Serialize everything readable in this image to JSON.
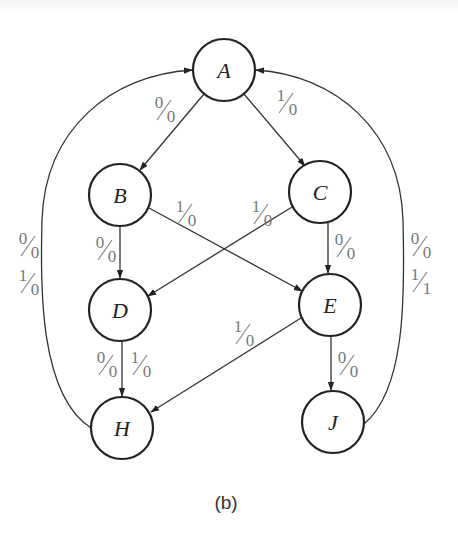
{
  "diagram": {
    "type": "state-diagram",
    "caption": "(b)",
    "states": [
      {
        "id": "A",
        "label": "A",
        "cx": 224,
        "cy": 70
      },
      {
        "id": "B",
        "label": "B",
        "cx": 120,
        "cy": 195
      },
      {
        "id": "C",
        "label": "C",
        "cx": 320,
        "cy": 192
      },
      {
        "id": "D",
        "label": "D",
        "cx": 120,
        "cy": 310
      },
      {
        "id": "E",
        "label": "E",
        "cx": 330,
        "cy": 305
      },
      {
        "id": "H",
        "label": "H",
        "cx": 122,
        "cy": 428
      },
      {
        "id": "J",
        "label": "J",
        "cx": 333,
        "cy": 422
      }
    ],
    "transitions": [
      {
        "from": "A",
        "to": "B",
        "label_in": "0",
        "label_out": "0",
        "label": "0/0"
      },
      {
        "from": "A",
        "to": "C",
        "label_in": "1",
        "label_out": "0",
        "label": "1/0"
      },
      {
        "from": "B",
        "to": "D",
        "label_in": "0",
        "label_out": "0",
        "label": "0/0"
      },
      {
        "from": "B",
        "to": "E",
        "label_in": "1",
        "label_out": "0",
        "label": "1/0"
      },
      {
        "from": "C",
        "to": "D",
        "label_in": "1",
        "label_out": "0",
        "label": "1/0"
      },
      {
        "from": "C",
        "to": "E",
        "label_in": "0",
        "label_out": "0",
        "label": "0/0"
      },
      {
        "from": "D",
        "to": "H",
        "label_in": "0",
        "label_out": "0",
        "label": "0/0"
      },
      {
        "from": "D",
        "to": "H",
        "label_in": "1",
        "label_out": "0",
        "label": "1/0"
      },
      {
        "from": "E",
        "to": "H",
        "label_in": "1",
        "label_out": "0",
        "label": "1/0"
      },
      {
        "from": "E",
        "to": "J",
        "label_in": "0",
        "label_out": "0",
        "label": "0/0"
      },
      {
        "from": "H",
        "to": "A",
        "label_in": "0",
        "label_out": "0",
        "label": "0/0"
      },
      {
        "from": "H",
        "to": "A",
        "label_in": "1",
        "label_out": "0",
        "label": "1/0"
      },
      {
        "from": "J",
        "to": "A",
        "label_in": "0",
        "label_out": "0",
        "label": "0/0"
      },
      {
        "from": "J",
        "to": "A",
        "label_in": "1",
        "label_out": "1",
        "label": "1/1"
      }
    ]
  },
  "labels": {
    "A": "A",
    "B": "B",
    "C": "C",
    "D": "D",
    "E": "E",
    "H": "H",
    "J": "J",
    "ab": {
      "num": "0",
      "den": "0"
    },
    "ac": {
      "num": "1",
      "den": "0"
    },
    "bd": {
      "num": "0",
      "den": "0"
    },
    "be": {
      "num": "1",
      "den": "0"
    },
    "cd": {
      "num": "1",
      "den": "0"
    },
    "ce": {
      "num": "0",
      "den": "0"
    },
    "dh0": {
      "num": "0",
      "den": "0"
    },
    "dh1": {
      "num": "1",
      "den": "0"
    },
    "eh": {
      "num": "1",
      "den": "0"
    },
    "ej": {
      "num": "0",
      "den": "0"
    },
    "ha0": {
      "num": "0",
      "den": "0"
    },
    "ha1": {
      "num": "1",
      "den": "0"
    },
    "ja0": {
      "num": "0",
      "den": "0"
    },
    "ja1": {
      "num": "1",
      "den": "1"
    },
    "caption": "(b)"
  }
}
